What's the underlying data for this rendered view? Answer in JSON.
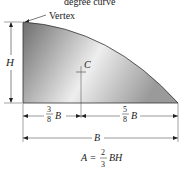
{
  "figure": {
    "title_partial": "degree curve",
    "vertex_label": "Vertex",
    "height_label": "H",
    "centroid_label": "C",
    "left_dim": {
      "num": "3",
      "den": "8",
      "var": "B"
    },
    "right_dim": {
      "num": "5",
      "den": "8",
      "var": "B"
    },
    "base_label": "B",
    "formula": {
      "lhs": "A =",
      "num": "2",
      "den": "3",
      "rhs": "BH"
    },
    "colors": {
      "fill_dark": "#6e6e6e",
      "fill_light": "#f2f2f2",
      "stroke": "#333333"
    }
  }
}
